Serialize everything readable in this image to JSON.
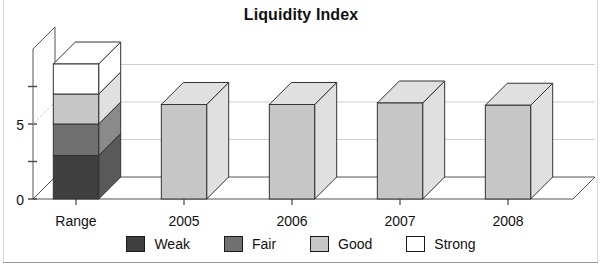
{
  "chart_data": {
    "type": "bar",
    "title": "Liquidity Index",
    "xlabel": "",
    "ylabel": "",
    "categories": [
      "Range",
      "2005",
      "2006",
      "2007",
      "2008"
    ],
    "ylim": [
      0,
      10
    ],
    "yticks": [
      0,
      2.5,
      5,
      7.5
    ],
    "ytick_labels": [
      "0",
      "",
      "5",
      ""
    ],
    "grid": true,
    "legend_position": "bottom",
    "style": "3d-stacked-column",
    "legend": [
      {
        "name": "Weak",
        "color": "#3f3f3f"
      },
      {
        "name": "Fair",
        "color": "#707070"
      },
      {
        "name": "Good",
        "color": "#c6c6c6"
      },
      {
        "name": "Strong",
        "color": "#ffffff"
      }
    ],
    "series": [
      {
        "name": "Weak",
        "color": "#3f3f3f",
        "values": [
          2.9,
          0,
          0,
          0,
          0
        ]
      },
      {
        "name": "Fair",
        "color": "#707070",
        "values": [
          2.1,
          0,
          0,
          0,
          0
        ]
      },
      {
        "name": "Good",
        "color": "#c6c6c6",
        "values": [
          2.0,
          6.3,
          6.3,
          6.4,
          6.25
        ]
      },
      {
        "name": "Strong",
        "color": "#ffffff",
        "values": [
          2.0,
          0,
          0,
          0,
          0
        ]
      }
    ],
    "bar_totals": [
      9.0,
      6.3,
      6.3,
      6.4,
      6.25
    ],
    "annotations": []
  }
}
